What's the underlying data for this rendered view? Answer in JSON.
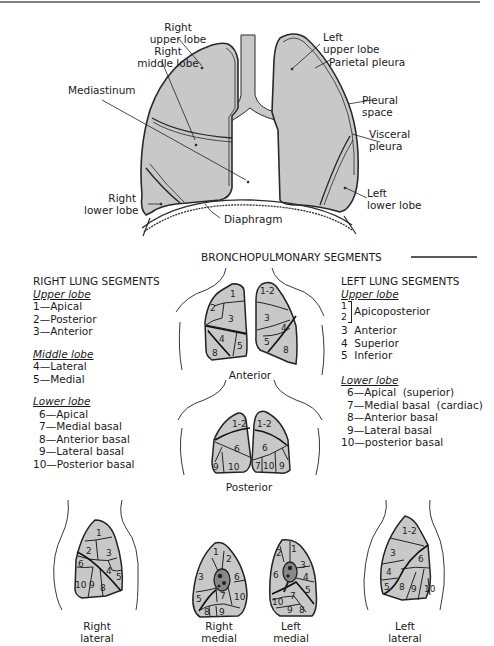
{
  "top_figure": {
    "labels": {
      "right_upper_lobe": [
        "Right",
        "upper lobe"
      ],
      "right_middle_lobe": [
        "Right",
        "middle lobe"
      ],
      "mediastinum": "Mediastinum",
      "right_lower_lobe": [
        "Right",
        "lower lobe"
      ],
      "diaphragm": "Diaphragm",
      "left_upper_lobe": [
        "Left",
        "upper lobe"
      ],
      "parietal_pleura": "Parietal pleura",
      "pleural_space": [
        "Pleural",
        "space"
      ],
      "visceral_pleura": [
        "Visceral",
        "pleura"
      ],
      "left_lower_lobe": [
        "Left",
        "lower lobe"
      ]
    }
  },
  "section_title": "BRONCHOPULMONARY SEGMENTS",
  "right_segments": {
    "title": "RIGHT LUNG SEGMENTS",
    "groups": [
      {
        "name": "Upper lobe",
        "items": [
          "1—Apical",
          "2—Posterior",
          "3—Anterior"
        ]
      },
      {
        "name": "Middle lobe",
        "items": [
          "4—Lateral",
          "5—Medial"
        ]
      },
      {
        "name": "Lower lobe",
        "items": [
          "6—Apical",
          "7—Medial basal",
          "8—Anterior basal",
          "9—Lateral basal",
          "10—Posterior basal"
        ]
      }
    ]
  },
  "left_segments": {
    "title": "LEFT LUNG SEGMENTS",
    "groups": [
      {
        "name": "Upper lobe",
        "apico_nums": [
          "1",
          "2"
        ],
        "apico_label": "Apicoposterior",
        "items": [
          "3  Anterior",
          "4  Superior",
          "5  Inferior"
        ]
      },
      {
        "name": "Lower lobe",
        "items": [
          "6—Apical  (superior)",
          "7—Medial basal  (cardiac)",
          "8—Anterior basal",
          "9—Lateral basal",
          "10—posterior basal"
        ]
      }
    ]
  },
  "views": {
    "anterior": "Anterior",
    "posterior": "Posterior",
    "right_lateral": [
      "Right",
      "lateral"
    ],
    "right_medial": [
      "Right",
      "medial"
    ],
    "left_medial": [
      "Left",
      "medial"
    ],
    "left_lateral": [
      "Left",
      "lateral"
    ]
  },
  "segment_numbers": {
    "anterior_right": [
      "1",
      "2",
      "3",
      "4",
      "5",
      "8"
    ],
    "anterior_left": [
      "1-2",
      "3",
      "4",
      "5",
      "8"
    ],
    "posterior_left_view": [
      "1-2",
      "6",
      "9",
      "10"
    ],
    "posterior_right_view": [
      "1-2",
      "6",
      "7",
      "10",
      "9"
    ],
    "right_lateral": [
      "1",
      "2",
      "3",
      "6",
      "4",
      "5",
      "10",
      "9",
      "8"
    ],
    "right_medial": [
      "1",
      "2",
      "3",
      "6",
      "7",
      "5",
      "10",
      "8",
      "9"
    ],
    "left_medial": [
      "2",
      "1",
      "3",
      "6",
      "4",
      "5",
      "10",
      "7",
      "9",
      "8"
    ],
    "left_lateral": [
      "1-2",
      "3",
      "6",
      "4",
      "5",
      "8",
      "9",
      "10"
    ]
  },
  "colors": {
    "lung_fill": "#c8c8c8",
    "line": "#222222",
    "background": "#ffffff"
  }
}
